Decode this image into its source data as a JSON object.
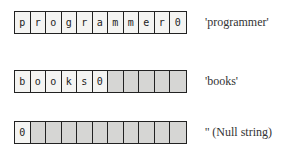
{
  "rows": [
    {
      "cells": [
        "p",
        "r",
        "o",
        "g",
        "r",
        "a",
        "m",
        "m",
        "e",
        "r",
        "0"
      ],
      "filled": 11,
      "label": "'programmer'"
    },
    {
      "cells": [
        "b",
        "o",
        "o",
        "k",
        "s",
        "0",
        "",
        "",
        "",
        "",
        ""
      ],
      "filled": 6,
      "label": "'books'"
    },
    {
      "cells": [
        "0",
        "",
        "",
        "",
        "",
        "",
        "",
        "",
        "",
        "",
        ""
      ],
      "filled": 1,
      "label": "'' (Null string)"
    }
  ]
}
